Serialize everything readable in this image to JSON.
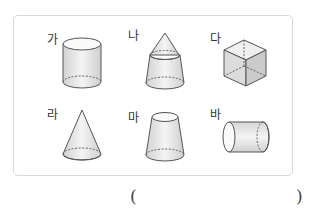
{
  "problem": {
    "figures": [
      {
        "label": "가",
        "shape": "cylinder-upright"
      },
      {
        "label": "나",
        "shape": "cone-on-frustum"
      },
      {
        "label": "다",
        "shape": "cube"
      },
      {
        "label": "라",
        "shape": "cone"
      },
      {
        "label": "마",
        "shape": "frustum"
      },
      {
        "label": "바",
        "shape": "cylinder-lying"
      }
    ],
    "answer": {
      "open_paren": "(",
      "close_paren": ")",
      "value": ""
    }
  }
}
